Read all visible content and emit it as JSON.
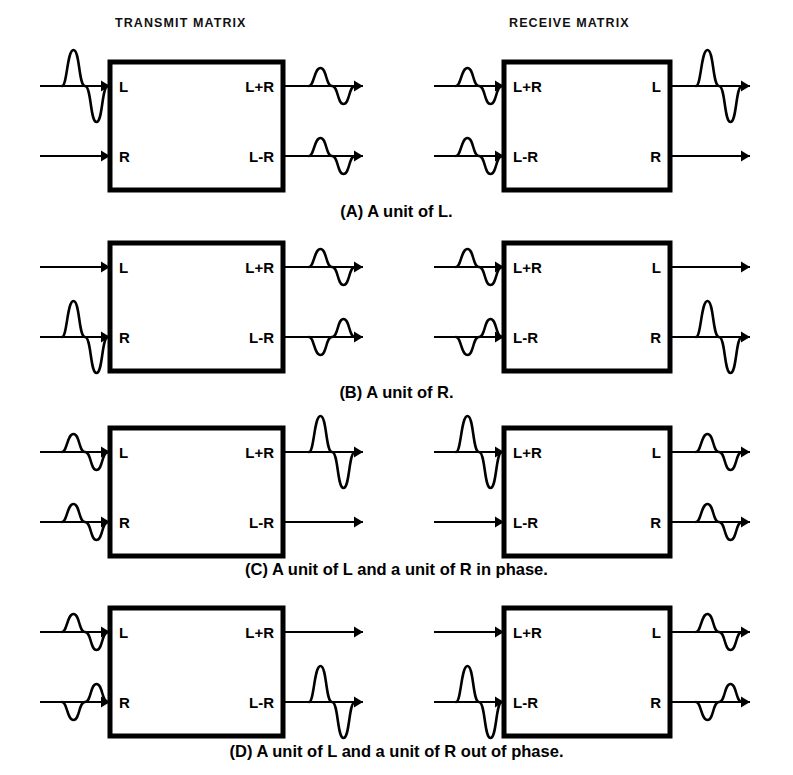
{
  "figure": {
    "column_headers": [
      {
        "label": "TRANSMIT MATRIX",
        "x": 115,
        "y": 16
      },
      {
        "label": "RECEIVE MATRIX",
        "x": 509,
        "y": 16
      }
    ]
  },
  "geometry": {
    "transmit_box": {
      "x": 110,
      "width": 173
    },
    "receive_box": {
      "x": 504,
      "width": 166
    },
    "box_height": 128,
    "row_offsets": {
      "top": 24,
      "bottom": 94
    },
    "panel_tops": [
      62,
      243,
      428,
      608
    ],
    "caption_tops": [
      202,
      383,
      560,
      742
    ],
    "input_wire": {
      "start_dx": -70,
      "end_dx": 0
    },
    "output_wire": {
      "start_dx": 0,
      "end_dx": 80
    },
    "wave_width": 46,
    "amplitudes": {
      "full": 36,
      "half": 18,
      "none": 0
    }
  },
  "panels": [
    {
      "id": "A",
      "caption": "(A) A unit of L.",
      "transmit": {
        "inputs": [
          {
            "port": "L",
            "amplitude": "full",
            "phase": "normal"
          },
          {
            "port": "R",
            "amplitude": "none",
            "phase": "normal"
          }
        ],
        "outputs": [
          {
            "port": "L+R",
            "amplitude": "half",
            "phase": "normal"
          },
          {
            "port": "L-R",
            "amplitude": "half",
            "phase": "normal"
          }
        ]
      },
      "receive": {
        "inputs": [
          {
            "port": "L+R",
            "amplitude": "half",
            "phase": "normal"
          },
          {
            "port": "L-R",
            "amplitude": "half",
            "phase": "normal"
          }
        ],
        "outputs": [
          {
            "port": "L",
            "amplitude": "full",
            "phase": "normal"
          },
          {
            "port": "R",
            "amplitude": "none",
            "phase": "normal"
          }
        ]
      }
    },
    {
      "id": "B",
      "caption": "(B) A unit of R.",
      "transmit": {
        "inputs": [
          {
            "port": "L",
            "amplitude": "none",
            "phase": "normal"
          },
          {
            "port": "R",
            "amplitude": "full",
            "phase": "normal"
          }
        ],
        "outputs": [
          {
            "port": "L+R",
            "amplitude": "half",
            "phase": "normal"
          },
          {
            "port": "L-R",
            "amplitude": "half",
            "phase": "inverted"
          }
        ]
      },
      "receive": {
        "inputs": [
          {
            "port": "L+R",
            "amplitude": "half",
            "phase": "normal"
          },
          {
            "port": "L-R",
            "amplitude": "half",
            "phase": "inverted"
          }
        ],
        "outputs": [
          {
            "port": "L",
            "amplitude": "none",
            "phase": "normal"
          },
          {
            "port": "R",
            "amplitude": "full",
            "phase": "normal"
          }
        ]
      }
    },
    {
      "id": "C",
      "caption": "(C) A unit of L and a unit of R in phase.",
      "transmit": {
        "inputs": [
          {
            "port": "L",
            "amplitude": "half",
            "phase": "normal"
          },
          {
            "port": "R",
            "amplitude": "half",
            "phase": "normal"
          }
        ],
        "outputs": [
          {
            "port": "L+R",
            "amplitude": "full",
            "phase": "normal"
          },
          {
            "port": "L-R",
            "amplitude": "none",
            "phase": "normal"
          }
        ]
      },
      "receive": {
        "inputs": [
          {
            "port": "L+R",
            "amplitude": "full",
            "phase": "normal"
          },
          {
            "port": "L-R",
            "amplitude": "none",
            "phase": "normal"
          }
        ],
        "outputs": [
          {
            "port": "L",
            "amplitude": "half",
            "phase": "normal"
          },
          {
            "port": "R",
            "amplitude": "half",
            "phase": "normal"
          }
        ]
      }
    },
    {
      "id": "D",
      "caption": "(D) A unit of L and a unit of R out of phase.",
      "transmit": {
        "inputs": [
          {
            "port": "L",
            "amplitude": "half",
            "phase": "normal"
          },
          {
            "port": "R",
            "amplitude": "half",
            "phase": "inverted"
          }
        ],
        "outputs": [
          {
            "port": "L+R",
            "amplitude": "none",
            "phase": "normal"
          },
          {
            "port": "L-R",
            "amplitude": "full",
            "phase": "normal"
          }
        ]
      },
      "receive": {
        "inputs": [
          {
            "port": "L+R",
            "amplitude": "none",
            "phase": "normal"
          },
          {
            "port": "L-R",
            "amplitude": "full",
            "phase": "normal"
          }
        ],
        "outputs": [
          {
            "port": "L",
            "amplitude": "half",
            "phase": "normal"
          },
          {
            "port": "R",
            "amplitude": "half",
            "phase": "inverted"
          }
        ]
      }
    }
  ]
}
